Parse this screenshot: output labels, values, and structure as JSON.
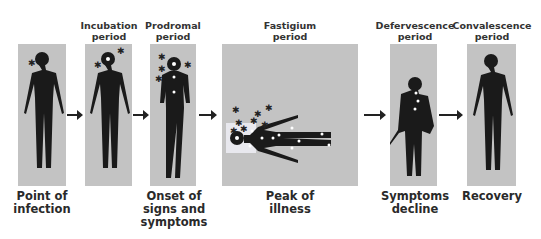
{
  "stages": [
    {
      "title": "",
      "caption": "Point of\ninfection"
    },
    {
      "title": "Incubation\nperiod",
      "caption": ""
    },
    {
      "title": "Prodromal\nperiod",
      "caption": "Onset of\nsigns and\nsymptoms"
    },
    {
      "title": "Fastigium\nperiod",
      "caption": "Peak of\nillness"
    },
    {
      "title": "Defervescence\nperiod",
      "caption": "Symptoms\ndecline"
    },
    {
      "title": "Convalescence\nperiod",
      "caption": "Recovery"
    }
  ],
  "colors": {
    "panel": "#c3c3c3",
    "figure": "#1a1a1a",
    "text": "#2a2a2a",
    "arrow": "#222222"
  }
}
